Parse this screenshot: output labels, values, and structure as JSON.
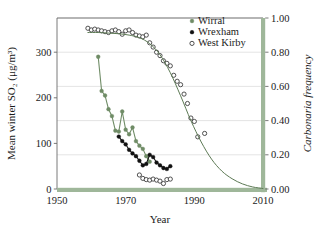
{
  "chart_data": {
    "type": "scatter",
    "title": "",
    "xlabel": "Year",
    "ylabel": "Mean winter SO₂ (μg/m³)",
    "ylabel_right": "Carbonaria frequency",
    "ylabel_right_italic_word": "Carbonaria",
    "xlim": [
      1950,
      2010
    ],
    "ylim": [
      0,
      375
    ],
    "ylim_right": [
      0.0,
      1.0
    ],
    "xticks": [
      1950,
      1970,
      1990,
      2010
    ],
    "xticklabels": [
      "1950",
      "1970",
      "1990",
      "2010"
    ],
    "yticks": [
      0,
      100,
      200,
      300
    ],
    "yticklabels": [
      "0",
      "100",
      "200",
      "300"
    ],
    "yticks_right": [
      0.0,
      0.2,
      0.4,
      0.6,
      0.8,
      1.0
    ],
    "yticklabels_right": [
      "0.00",
      "0.20",
      "0.40",
      "0.60",
      "0.80",
      "1.00"
    ],
    "grid": true,
    "grid_axis": "y-right",
    "legend_position": "top-right",
    "legend": [
      {
        "name": "Wirral",
        "marker": "filled-circle",
        "color": "#6f8c66",
        "axis": "left"
      },
      {
        "name": "Wrexham",
        "marker": "filled-circle",
        "color": "#111111",
        "axis": "left"
      },
      {
        "name": "West Kirby",
        "marker": "open-circle",
        "color": "#333333",
        "axis": "right"
      }
    ],
    "colors": {
      "wirral_green": "#6f8c66",
      "wrexham_black": "#111111",
      "westkirby_outline": "#333333",
      "fit_curve_green": "#5d7a55",
      "spine_band_green": "#9fb79a",
      "grid_gray": "#d9d9d9",
      "spine_gray": "#6b6b6b",
      "background": "#ffffff"
    },
    "series": [
      {
        "name": "Wirral",
        "axis": "left",
        "unit": "μg/m³",
        "marker": "filled-circle",
        "line": true,
        "color": "#6f8c66",
        "x": [
          1962,
          1963,
          1964,
          1965,
          1966,
          1967,
          1968,
          1969,
          1970,
          1971,
          1972,
          1973,
          1974,
          1975,
          1976,
          1977
        ],
        "y": [
          290,
          215,
          205,
          175,
          160,
          128,
          126,
          170,
          130,
          120,
          135,
          105,
          95,
          88,
          72,
          60
        ]
      },
      {
        "name": "Wrexham",
        "axis": "left",
        "unit": "μg/m³",
        "marker": "filled-circle",
        "line": true,
        "color": "#111111",
        "x": [
          1968,
          1969,
          1970,
          1971,
          1972,
          1973,
          1974,
          1975,
          1976,
          1977,
          1978,
          1979,
          1980,
          1981,
          1982,
          1983
        ],
        "y": [
          115,
          105,
          98,
          86,
          78,
          72,
          62,
          52,
          55,
          75,
          70,
          58,
          52,
          46,
          44,
          50
        ]
      },
      {
        "name": "West Kirby",
        "axis": "right",
        "unit": "frequency",
        "marker": "open-circle",
        "line": false,
        "color": "#333333",
        "x": [
          1959,
          1960,
          1961,
          1962,
          1963,
          1964,
          1965,
          1966,
          1967,
          1968,
          1969,
          1970,
          1971,
          1972,
          1973,
          1974,
          1975,
          1976,
          1977,
          1978,
          1979,
          1980,
          1981,
          1982,
          1983,
          1984,
          1985,
          1986,
          1987,
          1988,
          1989,
          1990,
          1991,
          1993
        ],
        "y": [
          0.94,
          0.93,
          0.935,
          0.93,
          0.925,
          0.92,
          0.915,
          0.925,
          0.93,
          0.92,
          0.905,
          0.925,
          0.93,
          0.915,
          0.9,
          0.895,
          0.89,
          0.9,
          0.855,
          0.83,
          0.8,
          0.78,
          0.75,
          0.735,
          0.72,
          0.665,
          0.63,
          0.61,
          0.555,
          0.5,
          0.415,
          0.395,
          0.305,
          0.325
        ]
      },
      {
        "name": "West Kirby low cluster",
        "axis": "right",
        "unit": "frequency",
        "marker": "open-circle",
        "line": false,
        "color": "#333333",
        "x": [
          1974,
          1975,
          1976,
          1977,
          1978,
          1979,
          1980,
          1981,
          1982,
          1983
        ],
        "y": [
          0.082,
          0.062,
          0.055,
          0.052,
          0.058,
          0.052,
          0.046,
          0.032,
          0.055,
          0.058
        ]
      },
      {
        "name": "Fitted decline curve",
        "axis": "right",
        "unit": "frequency",
        "marker": "none",
        "line": true,
        "color": "#5d7a55",
        "x": [
          1959,
          1962,
          1965,
          1968,
          1971,
          1974,
          1977,
          1980,
          1983,
          1986,
          1989,
          1992,
          1995,
          1998,
          2001,
          2004,
          2007,
          2010
        ],
        "y": [
          0.915,
          0.915,
          0.912,
          0.908,
          0.9,
          0.885,
          0.85,
          0.785,
          0.68,
          0.545,
          0.4,
          0.275,
          0.175,
          0.105,
          0.06,
          0.03,
          0.012,
          0.003
        ]
      }
    ],
    "annotations": []
  }
}
